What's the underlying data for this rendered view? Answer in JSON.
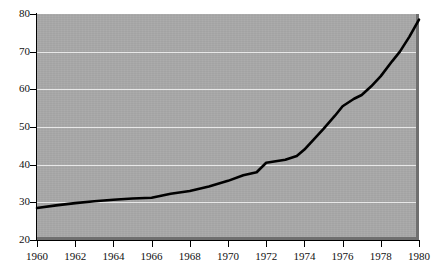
{
  "chart_data": {
    "type": "line",
    "title": "",
    "subtitle": "",
    "xlabel": "",
    "ylabel": "",
    "xlim": [
      1960,
      1980
    ],
    "ylim": [
      20,
      80
    ],
    "grid": true,
    "legend": null,
    "legend_position": "none",
    "background_color": "#a8a8a8",
    "line_color": "#000000",
    "gridline_color": "#e8e8e8",
    "x_tick_labels": [
      "1960",
      "1962",
      "1964",
      "1966",
      "1968",
      "1970",
      "1972",
      "1974",
      "1976",
      "1978",
      "1980"
    ],
    "x_ticks": [
      1960,
      1962,
      1964,
      1966,
      1968,
      1970,
      1972,
      1974,
      1976,
      1978,
      1980
    ],
    "y_tick_labels": [
      "20",
      "30",
      "40",
      "50",
      "60",
      "70",
      "80"
    ],
    "y_ticks": [
      20,
      30,
      40,
      50,
      60,
      70,
      80
    ],
    "series": [
      {
        "name": "series-1",
        "x": [
          1960,
          1961,
          1962,
          1963,
          1964,
          1965,
          1966,
          1967,
          1968,
          1969,
          1970,
          1971,
          1972,
          1973,
          1974,
          1975,
          1976,
          1977,
          1978,
          1979,
          1980
        ],
        "values": [
          28.5,
          29.2,
          29.8,
          30.3,
          30.7,
          31.0,
          31.2,
          32.2,
          32.8,
          34.0,
          35.5,
          37.3,
          40.5,
          41.2,
          42.2,
          45.5,
          49.5,
          53.0,
          56.5,
          59.5,
          60.8
        ]
      }
    ],
    "points": [
      {
        "x": 1960.0,
        "y": 28.5
      },
      {
        "x": 1961.0,
        "y": 29.2
      },
      {
        "x": 1962.0,
        "y": 29.8
      },
      {
        "x": 1963.0,
        "y": 30.3
      },
      {
        "x": 1964.0,
        "y": 30.7
      },
      {
        "x": 1965.0,
        "y": 31.0
      },
      {
        "x": 1966.0,
        "y": 31.2
      },
      {
        "x": 1967.0,
        "y": 32.3
      },
      {
        "x": 1968.0,
        "y": 33.0
      },
      {
        "x": 1969.0,
        "y": 34.2
      },
      {
        "x": 1970.0,
        "y": 35.7
      },
      {
        "x": 1970.8,
        "y": 37.2
      },
      {
        "x": 1971.5,
        "y": 38.0
      },
      {
        "x": 1972.0,
        "y": 40.5
      },
      {
        "x": 1973.0,
        "y": 41.3
      },
      {
        "x": 1973.6,
        "y": 42.3
      },
      {
        "x": 1974.0,
        "y": 44.0
      },
      {
        "x": 1975.0,
        "y": 49.5
      },
      {
        "x": 1975.6,
        "y": 53.0
      },
      {
        "x": 1976.0,
        "y": 55.5
      },
      {
        "x": 1976.6,
        "y": 57.5
      },
      {
        "x": 1977.0,
        "y": 58.5
      },
      {
        "x": 1977.5,
        "y": 60.8
      },
      {
        "x": 1978.0,
        "y": 63.5
      },
      {
        "x": 1978.6,
        "y": 67.5
      },
      {
        "x": 1979.0,
        "y": 70.0
      },
      {
        "x": 1979.5,
        "y": 74.0
      },
      {
        "x": 1980.0,
        "y": 78.5
      }
    ]
  }
}
